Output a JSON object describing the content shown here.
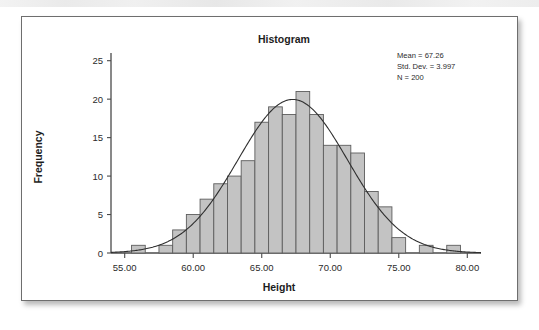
{
  "figure": {
    "title": "Histogram",
    "stats": [
      "Mean = 67.26",
      "Std. Dev. = 3.997",
      "N = 200"
    ]
  },
  "chart_data": {
    "type": "bar",
    "title": "Histogram",
    "xlabel": "Height",
    "ylabel": "Frequency",
    "xlim": [
      54.0,
      81.0
    ],
    "ylim": [
      0,
      26
    ],
    "x_ticks": [
      "55.00",
      "60.00",
      "65.00",
      "70.00",
      "75.00",
      "80.00"
    ],
    "x_tick_values": [
      55,
      60,
      65,
      70,
      75,
      80
    ],
    "y_ticks": [
      "0",
      "5",
      "10",
      "15",
      "20",
      "25"
    ],
    "y_tick_values": [
      0,
      5,
      10,
      15,
      20,
      25
    ],
    "grid": false,
    "legend": null,
    "bin_width": 1,
    "bin_starts": [
      55.5,
      57.5,
      58.5,
      59.5,
      60.5,
      61.5,
      62.5,
      63.5,
      64.5,
      65.5,
      66.5,
      67.5,
      68.5,
      69.5,
      70.5,
      71.5,
      72.5,
      73.5,
      74.5,
      76.5,
      78.5
    ],
    "categories": [
      "56",
      "58",
      "59",
      "60",
      "61",
      "62",
      "63",
      "64",
      "65",
      "66",
      "67",
      "68",
      "69",
      "70",
      "71",
      "72",
      "73",
      "74",
      "75",
      "77",
      "79"
    ],
    "values": [
      1,
      1,
      3,
      5,
      7,
      9,
      10,
      12,
      17,
      19,
      18,
      21,
      18,
      14,
      14,
      13,
      8,
      6,
      2,
      1,
      1
    ],
    "overlay": {
      "type": "normal_curve",
      "mean": 67.26,
      "std_dev": 3.997,
      "n": 200,
      "scale_bin_width": 1
    },
    "annotations": [
      "Mean = 67.26",
      "Std. Dev. = 3.997",
      "N = 200"
    ],
    "colors": {
      "bar_fill": "#c3c3c3",
      "bar_stroke": "#5d5d5d",
      "curve": "#2f2f2f",
      "axis": "#4a4a4a",
      "text": "#1d1d1d",
      "card_border": "#6e6e6e",
      "background": "#ffffff"
    }
  }
}
